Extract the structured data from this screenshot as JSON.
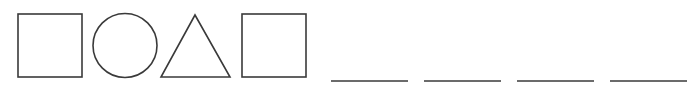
{
  "diagram": {
    "stroke_color": "#3a3a3a",
    "background": "#ffffff",
    "shapes": [
      {
        "type": "square",
        "x": 18,
        "y": 14,
        "w": 64,
        "h": 63
      },
      {
        "type": "circle",
        "cx": 125,
        "cy": 45.5,
        "r": 32
      },
      {
        "type": "triangle",
        "points": "195,15 161,77 230,77"
      },
      {
        "type": "square",
        "x": 242,
        "y": 14,
        "w": 64,
        "h": 63
      }
    ],
    "blanks": [
      {
        "x1": 331,
        "x2": 408,
        "y": 81
      },
      {
        "x1": 424,
        "x2": 501,
        "y": 81
      },
      {
        "x1": 517,
        "x2": 594,
        "y": 81
      },
      {
        "x1": 610,
        "x2": 687,
        "y": 81
      }
    ]
  }
}
